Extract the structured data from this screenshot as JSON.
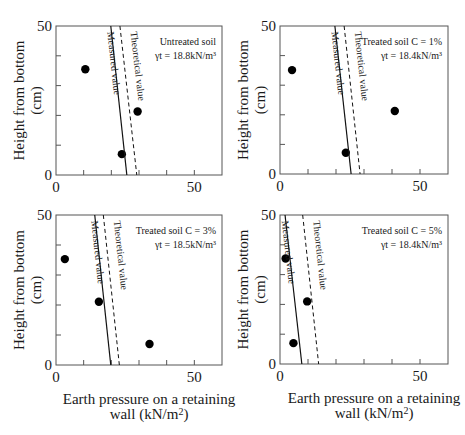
{
  "chart_data": [
    {
      "type": "scatter",
      "title": "Untreated soil",
      "annotation": [
        "Untreated soil",
        "γt = 18.8kN/m³"
      ],
      "xlabel": "Earth pressure on a retaining wall (kN/m²)",
      "ylabel": "Height from bottom (cm)",
      "xlim": [
        0,
        60
      ],
      "ylim": [
        0,
        50
      ],
      "xticks": [
        0,
        10,
        20,
        30,
        40,
        50,
        60
      ],
      "xtick_labels": [
        "0",
        "50"
      ],
      "yticks": [
        0,
        10,
        20,
        30,
        40,
        50
      ],
      "ytick_labels": [
        "0",
        "50"
      ],
      "series": [
        {
          "name": "Measured points",
          "kind": "points",
          "x": [
            10.6,
            23.8,
            29.5
          ],
          "y": [
            35.5,
            7.0,
            21.3
          ]
        },
        {
          "name": "Measured value",
          "kind": "line",
          "style": "solid",
          "x": [
            19.8,
            25.6
          ],
          "y": [
            50,
            0
          ]
        },
        {
          "name": "Theoretical value",
          "kind": "line",
          "style": "dashed",
          "x": [
            23.1,
            29.2
          ],
          "y": [
            50,
            0
          ]
        }
      ]
    },
    {
      "type": "scatter",
      "title": "Treated soil C = 1%",
      "annotation": [
        "Treated soil C = 1%",
        "γt = 18.4kN/m³"
      ],
      "xlabel": "Earth pressure on a retaining wall (kN/m²)",
      "ylabel": "Height from bottom (cm)",
      "xlim": [
        0,
        60
      ],
      "ylim": [
        0,
        50
      ],
      "xticks": [
        0,
        10,
        20,
        30,
        40,
        50,
        60
      ],
      "xtick_labels": [
        "0",
        "50"
      ],
      "yticks": [
        0,
        10,
        20,
        30,
        40,
        50
      ],
      "ytick_labels": [
        "0",
        "50"
      ],
      "series": [
        {
          "name": "Measured points",
          "kind": "points",
          "x": [
            4.3,
            23.5,
            41.0
          ],
          "y": [
            35.1,
            7.2,
            21.3
          ]
        },
        {
          "name": "Measured value",
          "kind": "line",
          "style": "solid",
          "x": [
            19.6,
            25.4
          ],
          "y": [
            50,
            0
          ]
        },
        {
          "name": "Theoretical value",
          "kind": "line",
          "style": "dashed",
          "x": [
            22.9,
            28.6
          ],
          "y": [
            50,
            0
          ]
        }
      ]
    },
    {
      "type": "scatter",
      "title": "Treated soil C = 3%",
      "annotation": [
        "Treated soil C = 3%",
        "γt = 18.5kN/m³"
      ],
      "xlabel": "Earth pressure on a retaining wall (kN/m²)",
      "ylabel": "Height from bottom (cm)",
      "xlim": [
        0,
        60
      ],
      "ylim": [
        0,
        50
      ],
      "xticks": [
        0,
        10,
        20,
        30,
        40,
        50,
        60
      ],
      "xtick_labels": [
        "0",
        "50"
      ],
      "yticks": [
        0,
        10,
        20,
        30,
        40,
        50
      ],
      "ytick_labels": [
        "0",
        "50"
      ],
      "series": [
        {
          "name": "Measured points",
          "kind": "points",
          "x": [
            3.2,
            15.5,
            33.8
          ],
          "y": [
            35.3,
            21.1,
            7.0
          ]
        },
        {
          "name": "Measured value",
          "kind": "line",
          "style": "solid",
          "x": [
            14.0,
            19.8
          ],
          "y": [
            50,
            0
          ]
        },
        {
          "name": "Theoretical value",
          "kind": "line",
          "style": "dashed",
          "x": [
            17.1,
            22.9
          ],
          "y": [
            50,
            0
          ]
        }
      ]
    },
    {
      "type": "scatter",
      "title": "Treated soil C = 5%",
      "annotation": [
        "Treated soil C = 5%",
        "γt = 18.4kN/m³"
      ],
      "xlabel": "Earth pressure on a retaining wall (kN/m²)",
      "ylabel": "Height from bottom (cm)",
      "xlim": [
        0,
        60
      ],
      "ylim": [
        0,
        50
      ],
      "xticks": [
        0,
        10,
        20,
        30,
        40,
        50,
        60
      ],
      "xtick_labels": [
        "0",
        "50"
      ],
      "yticks": [
        0,
        10,
        20,
        30,
        40,
        50
      ],
      "ytick_labels": [
        "0",
        "50"
      ],
      "series": [
        {
          "name": "Measured points",
          "kind": "points",
          "x": [
            2.0,
            9.7,
            4.8
          ],
          "y": [
            35.4,
            21.0,
            7.0
          ]
        },
        {
          "name": "Measured value",
          "kind": "line",
          "style": "solid",
          "x": [
            1.8,
            7.8
          ],
          "y": [
            50,
            0
          ]
        },
        {
          "name": "Theoretical value",
          "kind": "line",
          "style": "dashed",
          "x": [
            8.1,
            13.8
          ],
          "y": [
            50,
            0
          ]
        }
      ]
    }
  ],
  "labels": {
    "measured_line": "Measured value",
    "theoretical_line": "Theoretical value",
    "ylabel_line1": "Height from bottom",
    "ylabel_line2": "(cm)",
    "xlabel_line1": "Earth pressure on a retaining",
    "xlabel_line2": "wall (kN/m",
    "xlabel_sup": "2",
    "xlabel_close": ")"
  },
  "layout": {
    "panels": [
      {
        "left": 56,
        "top": 26,
        "right": 222,
        "bottom": 175,
        "show_xlabel": false
      },
      {
        "left": 280,
        "top": 26,
        "right": 448,
        "bottom": 174,
        "show_xlabel": false
      },
      {
        "left": 56,
        "top": 215,
        "right": 222,
        "bottom": 365,
        "show_xlabel": true
      },
      {
        "left": 280,
        "top": 215,
        "right": 448,
        "bottom": 364,
        "show_xlabel": true
      }
    ],
    "axis_color": "#555555",
    "marker_color": "#000000",
    "line_color": "#111111"
  }
}
